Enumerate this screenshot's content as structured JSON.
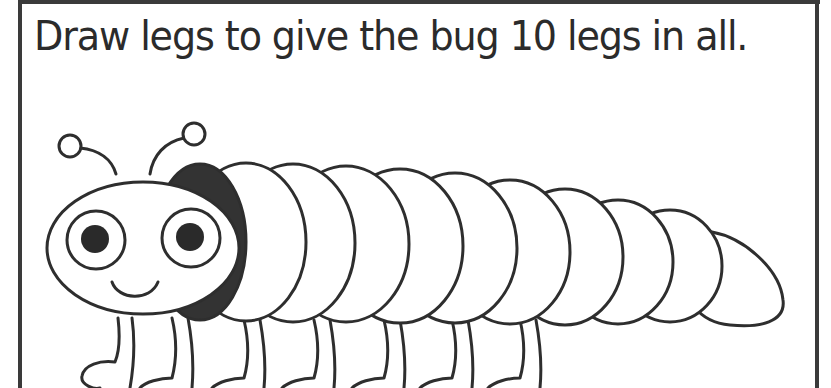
{
  "worksheet": {
    "instruction": "Draw legs to give the bug 10 legs in all.",
    "target_leg_count": 10
  },
  "illustration": {
    "subject": "caterpillar-bug",
    "body_segments": 10,
    "collar_color": "#333333",
    "outline_color": "#2e2e2e",
    "pupil_color": "#2a2a2a",
    "background_color": "#ffffff"
  }
}
